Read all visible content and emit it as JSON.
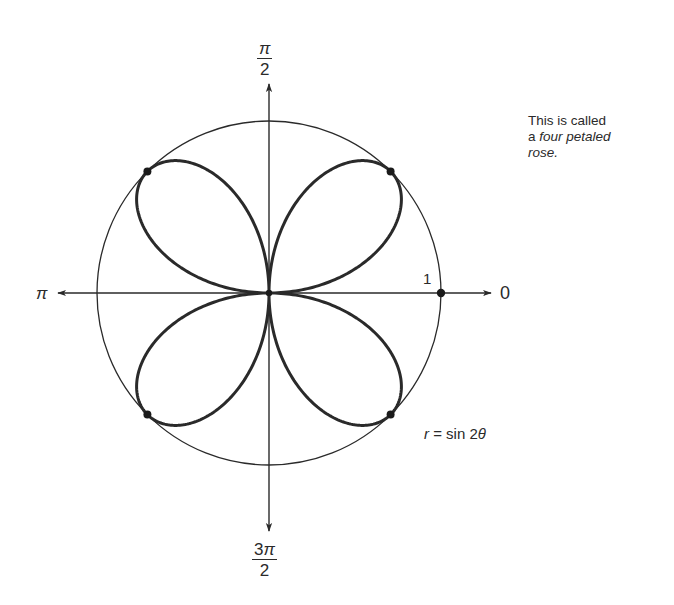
{
  "figure": {
    "title": "Four petaled rose",
    "equation": {
      "lhs": "r",
      "op": "=",
      "rhs_fn": "sin",
      "rhs_coef": "2",
      "rhs_var": "θ"
    },
    "caption": {
      "line1": "This is called",
      "line2_prefix": "a ",
      "line2_italic": "four petaled",
      "line3_italic": "rose."
    },
    "axis_labels": {
      "top": {
        "numerator": "π",
        "denominator": "2"
      },
      "bottom": {
        "numerator_coef": "3",
        "numerator": "π",
        "denominator": "2"
      },
      "left": "π",
      "right": "0",
      "unit_radius": "1"
    },
    "colors": {
      "curve": "#2a2a2a",
      "axes": "#2a2a2a",
      "background": "#ffffff"
    }
  },
  "chart_data": {
    "type": "line",
    "coordinate_system": "polar",
    "title": "r = sin 2θ",
    "series": [
      {
        "name": "r = sin 2θ",
        "function": "sin(2θ)",
        "theta_range": [
          0,
          6.283185
        ],
        "petals": 4,
        "petal_tips": [
          {
            "theta": "π/4",
            "r": 1
          },
          {
            "theta": "3π/4",
            "r": -1
          },
          {
            "theta": "5π/4",
            "r": 1
          },
          {
            "theta": "7π/4",
            "r": -1
          }
        ]
      },
      {
        "name": "unit circle",
        "function": "r = 1"
      }
    ],
    "marked_points": [
      {
        "label": "1",
        "theta": 0,
        "r": 1
      },
      {
        "theta": "π/4",
        "r": 1
      },
      {
        "theta": "3π/4",
        "r": 1
      },
      {
        "theta": "5π/4",
        "r": 1
      },
      {
        "theta": "7π/4",
        "r": 1
      }
    ],
    "angle_labels": [
      "0",
      "π/2",
      "π",
      "3π/2"
    ],
    "radial_ticks": [
      "1"
    ],
    "rlim": [
      0,
      1
    ],
    "grid": false,
    "annotations": [
      "This is called a four petaled rose.",
      "r = sin 2θ"
    ]
  }
}
